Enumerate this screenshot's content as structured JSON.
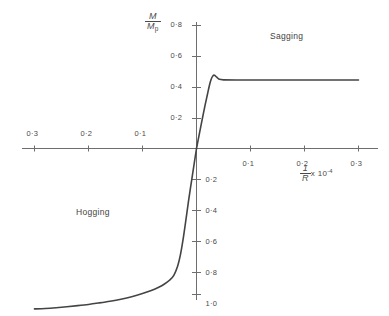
{
  "chart_data": {
    "type": "line",
    "title": "",
    "xlabel": "1/R x 10^-4",
    "ylabel": "M / Mp",
    "xlim": [
      -0.33,
      0.33
    ],
    "ylim": [
      -1.1,
      0.88
    ],
    "grid": false,
    "legend": "none",
    "x_ticks_left": [
      "0·3",
      "0·2",
      "0·1"
    ],
    "x_tick_values_left": [
      -0.3,
      -0.2,
      -0.1
    ],
    "x_ticks_right": [
      "0·1",
      "0·2",
      "0·3"
    ],
    "x_tick_values_right": [
      0.1,
      0.2,
      0.3
    ],
    "y_ticks_positive": [
      "0·8",
      "0·6",
      "0·4",
      "0·2"
    ],
    "y_tick_values_positive": [
      0.8,
      0.6,
      0.4,
      0.2
    ],
    "y_ticks_negative": [
      "0·2",
      "0·4",
      "0·6",
      "0·8",
      "1·0"
    ],
    "y_tick_values_negative": [
      -0.2,
      -0.4,
      -0.6,
      -0.8,
      -1.0
    ],
    "series": [
      {
        "name": "Sagging branch",
        "x": [
          0.0,
          0.004,
          0.008,
          0.012,
          0.016,
          0.02,
          0.024,
          0.027,
          0.03,
          0.033,
          0.037,
          0.042,
          0.05,
          0.08,
          0.12,
          0.16,
          0.2,
          0.24,
          0.28,
          0.3
        ],
        "y": [
          0.0,
          0.072,
          0.143,
          0.213,
          0.281,
          0.345,
          0.408,
          0.445,
          0.467,
          0.473,
          0.462,
          0.447,
          0.443,
          0.442,
          0.442,
          0.442,
          0.442,
          0.442,
          0.442,
          0.442
        ]
      },
      {
        "name": "Hogging branch",
        "x": [
          -0.3,
          -0.28,
          -0.26,
          -0.24,
          -0.22,
          -0.2,
          -0.18,
          -0.16,
          -0.14,
          -0.12,
          -0.1,
          -0.085,
          -0.07,
          -0.06,
          -0.05,
          -0.042,
          -0.035,
          -0.03,
          -0.025,
          -0.02,
          -0.015,
          -0.01,
          -0.005,
          0.0
        ],
        "y": [
          -1.035,
          -1.032,
          -1.027,
          -1.021,
          -1.014,
          -1.006,
          -0.996,
          -0.985,
          -0.972,
          -0.956,
          -0.936,
          -0.918,
          -0.895,
          -0.876,
          -0.85,
          -0.818,
          -0.76,
          -0.69,
          -0.59,
          -0.47,
          -0.345,
          -0.228,
          -0.113,
          0.0
        ]
      }
    ],
    "annotations": [
      {
        "text": "Sagging",
        "x": 0.12,
        "y": 0.69
      },
      {
        "text": "Hogging",
        "x": -0.2,
        "y": -0.52
      }
    ]
  },
  "labels": {
    "y_axis_numerator": "M",
    "y_axis_denominator": "M",
    "y_axis_denominator_sub": "p",
    "x_axis_numerator": "1",
    "x_axis_denominator": "R",
    "x_axis_multiplier": "x 10",
    "x_axis_exponent": "-4",
    "sagging": "Sagging",
    "hogging": "Hogging"
  },
  "colors": {
    "background": "#ffffff",
    "axis": "#6e6e6e",
    "curve": "#444444",
    "text": "#4a4a4a"
  }
}
